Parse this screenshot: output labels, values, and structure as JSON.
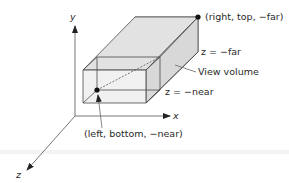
{
  "diagram": {
    "type": "orthographic-view-volume",
    "axes": {
      "x_label": "x",
      "y_label": "y",
      "z_label": "z"
    },
    "labels": {
      "far_corner": "(right, top, −far)",
      "far_plane": "z = −far",
      "view_volume": "View volume",
      "near_plane": "z = −near",
      "near_corner": "(left, bottom, −near)"
    },
    "colors": {
      "far_face": "#8c8c8c",
      "side_face": "#d9d9d9",
      "near_face": "#e4e4e4",
      "line": "#4a4a4a",
      "axis": "#555555",
      "point": "#111111",
      "ground_band": "#f2f2f2"
    }
  }
}
